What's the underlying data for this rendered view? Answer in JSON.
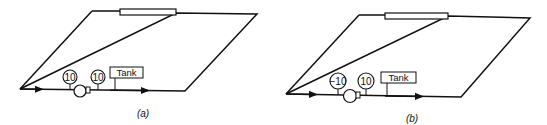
{
  "panels": [
    {
      "id": "a",
      "caption": "(a)",
      "gauge_left": "10",
      "gauge_right": "10",
      "tank_label": "Tank"
    },
    {
      "id": "b",
      "caption": "(b)",
      "gauge_left": "−10",
      "gauge_right": "10",
      "tank_label": "Tank"
    }
  ],
  "colors": {
    "line": "#111111",
    "background": "#ffffff"
  }
}
